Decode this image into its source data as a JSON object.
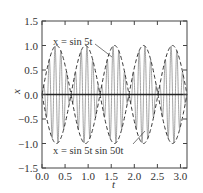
{
  "chart_data": {
    "type": "line",
    "title": "",
    "xlabel": "t",
    "ylabel": "x",
    "xlim": [
      0,
      3.1416
    ],
    "ylim": [
      -1.5,
      1.5
    ],
    "xticks": [
      0.0,
      0.5,
      1.0,
      1.5,
      2.0,
      2.5,
      3.0
    ],
    "xtick_labels": [
      "0.0",
      "0.5",
      "1.0",
      "1.5",
      "2.0",
      "2.5",
      "3.0"
    ],
    "yticks": [
      1.5,
      1.0,
      0.5,
      0.0,
      -0.5,
      -1.0,
      -1.5
    ],
    "ytick_labels": [
      "1.5",
      "1.0",
      "0.5",
      "0.0",
      "−0.5",
      "−1.0",
      "−1.5"
    ],
    "grid": false,
    "legend": "none (inline annotations)",
    "series": [
      {
        "name": "x = sin 5t",
        "expression": "sin(5t)",
        "style": "dashed envelope",
        "color": "#333333"
      },
      {
        "name": "x = −sin 5t",
        "expression": "-sin(5t)",
        "style": "dashed envelope",
        "color": "#333333"
      },
      {
        "name": "x = sin 5t sin 50t",
        "expression": "sin(5t)*sin(50t)",
        "style": "solid thin gray",
        "color": "#8a8a8a"
      },
      {
        "name": "zero line",
        "expression": "0",
        "style": "solid",
        "color": "#222222"
      }
    ],
    "annotations": [
      {
        "text": "x = sin 5t",
        "target": "envelope",
        "approx_at": [
          1.6,
          0.8
        ]
      },
      {
        "text": "x = sin 5t sin 50t",
        "target": "modulated",
        "approx_at": [
          2.2,
          -0.75
        ]
      }
    ]
  },
  "labels": {
    "ylabel": "x",
    "xlabel": "t",
    "annot1": "x = sin 5t",
    "annot2": "x = sin 5t sin 50t"
  }
}
